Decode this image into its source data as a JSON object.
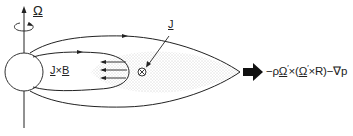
{
  "diagram": {
    "rotation_label": "Ω",
    "current_label": "J",
    "force_label_left": "J",
    "force_label_op": "×",
    "force_label_right": "B",
    "formula": {
      "prefix": "−ρ",
      "omega1": "Ω",
      "prime1": "′",
      "times1": "×(",
      "omega2": "Ω",
      "prime2": "′",
      "rest": "×R)−∇p"
    },
    "elements": {
      "rotation_axis": "vertical axis with upward arrow",
      "rotation_indicator": "curved arrow around axis",
      "planet": "circle",
      "field_lines": [
        "outer closed field line",
        "inner closed field line"
      ],
      "current_direction": "into page (⊗)",
      "jxb_arrows": 3,
      "plasma_sheet": "stippled equatorial region",
      "outward_force_arrow": "bold right arrow"
    },
    "colors": {
      "line": "#222222",
      "stipple": "#b8b8b8",
      "background": "#ffffff"
    }
  }
}
